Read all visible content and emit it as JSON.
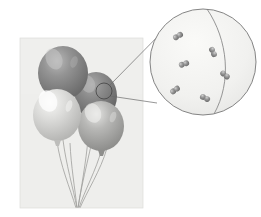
{
  "figure": {
    "name": "balloons-with-molecular-magnification",
    "width": 261,
    "height": 217,
    "background_color": "#ffffff"
  },
  "photo": {
    "name": "balloon-photograph",
    "x": 20,
    "y": 38,
    "width": 123,
    "height": 170,
    "background_color": "#ebebea",
    "border_color": "#d8d8d6"
  },
  "balloons": [
    {
      "id": "balloon-dark-top",
      "label": "dark gray balloon, upper left",
      "cx": 63,
      "cy": 73,
      "rx": 25,
      "ry": 27,
      "body_color": "#8a8a8a",
      "shade_color": "#6e6e6e",
      "highlight_color": "#b8b8b8"
    },
    {
      "id": "balloon-dark-right",
      "label": "dark gray balloon, right rear",
      "cx": 96,
      "cy": 96,
      "rx": 21,
      "ry": 24,
      "body_color": "#808080",
      "shade_color": "#666666",
      "highlight_color": "#a8a8a8"
    },
    {
      "id": "balloon-light-left",
      "label": "white balloon, lower left",
      "cx": 57,
      "cy": 115,
      "rx": 24,
      "ry": 26,
      "body_color": "#d6d6d4",
      "shade_color": "#bdbdbb",
      "highlight_color": "#f4f4f2"
    },
    {
      "id": "balloon-mid-right",
      "label": "medium gray balloon, lower right",
      "cx": 101,
      "cy": 126,
      "rx": 23,
      "ry": 25,
      "body_color": "#b0b0ae",
      "shade_color": "#949492",
      "highlight_color": "#e2e2e0"
    }
  ],
  "strings": {
    "name": "balloon-strings",
    "count": 7,
    "color": "#9a9a98",
    "converge_x": 76,
    "converge_y": 208
  },
  "callout_marker": {
    "name": "magnification-source-circle",
    "cx": 104,
    "cy": 91,
    "r": 8,
    "stroke_color": "#4a4a4a"
  },
  "leader_lines": {
    "name": "callout-leader-lines",
    "color": "#6a6a6a",
    "upper": {
      "x1": 109,
      "y1": 86,
      "x2": 170,
      "y2": 24
    },
    "lower": {
      "x1": 110,
      "y1": 95,
      "x2": 160,
      "y2": 100
    }
  },
  "magnified_view": {
    "name": "magnified-gas-circle",
    "cx": 203,
    "cy": 62,
    "r": 53,
    "fill_color": "#f2f2f0",
    "stroke_color": "#777777",
    "membrane_arc_color": "#8a8a8a",
    "membrane_label": "balloon wall"
  },
  "molecules": {
    "name": "gas-molecules",
    "count": 6,
    "type": "diatomic",
    "sphere_color": "#8c8c8c",
    "sphere_highlight": "#c8c8c8",
    "items": [
      {
        "id": "molecule-1",
        "x": 178,
        "y": 36,
        "angle": -30
      },
      {
        "id": "molecule-2",
        "x": 213,
        "y": 52,
        "angle": 65
      },
      {
        "id": "molecule-3",
        "x": 184,
        "y": 64,
        "angle": -20
      },
      {
        "id": "molecule-4",
        "x": 225,
        "y": 75,
        "angle": 40
      },
      {
        "id": "molecule-5",
        "x": 175,
        "y": 90,
        "angle": -35
      },
      {
        "id": "molecule-6",
        "x": 205,
        "y": 98,
        "angle": 25
      }
    ]
  }
}
